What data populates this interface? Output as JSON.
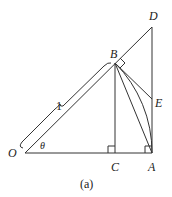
{
  "diagram": {
    "caption": "(a)",
    "points": {
      "O": {
        "label": "O",
        "x": 25,
        "y": 153
      },
      "C": {
        "label": "C",
        "x": 115,
        "y": 153
      },
      "A": {
        "label": "A",
        "x": 152,
        "y": 153
      },
      "B": {
        "label": "B",
        "x": 115,
        "y": 63
      },
      "D": {
        "label": "D",
        "x": 152,
        "y": 27
      },
      "E": {
        "label": "E",
        "x": 152,
        "y": 99
      }
    },
    "angle_label": "θ",
    "length_label": "1",
    "segments": [
      "O-A",
      "O-D",
      "A-D",
      "B-C",
      "B-A",
      "B-E"
    ],
    "arc": "B-A (unit circle arc centered at O)",
    "right_angles": [
      "at C (BC ⊥ OA)",
      "at A (AD ⊥ OA)",
      "at B (BE ⊥ OD)"
    ],
    "brace": "O-B labeled 1",
    "stroke_color": "#333333"
  }
}
